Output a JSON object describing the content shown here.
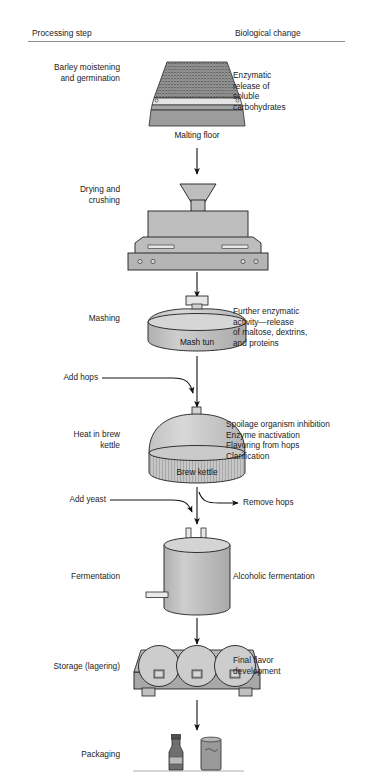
{
  "headers": {
    "left": "Processing step",
    "right": "Biological change"
  },
  "steps": [
    {
      "id": "malting",
      "label": "Barley moistening\nand germination",
      "equipment_caption": "Malting floor",
      "biological_change": "Enzymatic\nrelease of\nsoluble\ncarbohydrates"
    },
    {
      "id": "drying",
      "label": "Drying and\ncrushing",
      "equipment_caption": "",
      "biological_change": ""
    },
    {
      "id": "mashing",
      "label": "Mashing",
      "equipment_caption": "Mash tun",
      "biological_change": "Further enzymatic\nactivity—release\nof maltose, dextrins,\nand proteins"
    },
    {
      "id": "boiling",
      "label": "Heat in brew\nkettle",
      "equipment_caption": "Brew kettle",
      "biological_change": "Spoilage organism inhibition\nEnzyme inactivation\nFlavoring from hops\nClarification"
    },
    {
      "id": "fermentation",
      "label": "Fermentation",
      "equipment_caption": "",
      "biological_change": "Alcoholic fermentation"
    },
    {
      "id": "storage",
      "label": "Storage (lagering)",
      "equipment_caption": "",
      "biological_change": "Final flavor\ndevelopment"
    },
    {
      "id": "packaging",
      "label": "Packaging",
      "equipment_caption": "",
      "biological_change": ""
    }
  ],
  "annotations": {
    "add_hops": "Add hops",
    "add_yeast": "Add yeast",
    "remove_hops": "Remove hops"
  },
  "colors": {
    "fill_light": "#cfcfcf",
    "fill_mid": "#bdbdbd",
    "fill_dark": "#9a9a9a",
    "fill_darker": "#7f7f7f",
    "stroke": "#1a1a1a",
    "rule": "#8b8b8b",
    "text": "#1d1d1d"
  }
}
